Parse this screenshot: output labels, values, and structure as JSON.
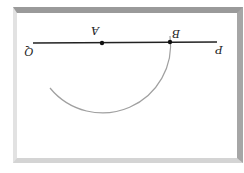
{
  "diagram": {
    "orientation": "rotated 180 degrees",
    "labels": {
      "point_a": "A",
      "point_b": "B",
      "end_q": "Q",
      "end_p": "P"
    },
    "colors": {
      "line": "#222222",
      "arc": "#9a9a9a",
      "frame_dark": "#9a9a9a",
      "frame_light": "#e2e2e2"
    },
    "elements": [
      {
        "type": "segment",
        "from": "Q",
        "to": "P",
        "passes_through": [
          "A",
          "B"
        ]
      },
      {
        "type": "point",
        "name": "A"
      },
      {
        "type": "point",
        "name": "B"
      },
      {
        "type": "arc",
        "center": "A",
        "through": "B"
      }
    ]
  }
}
